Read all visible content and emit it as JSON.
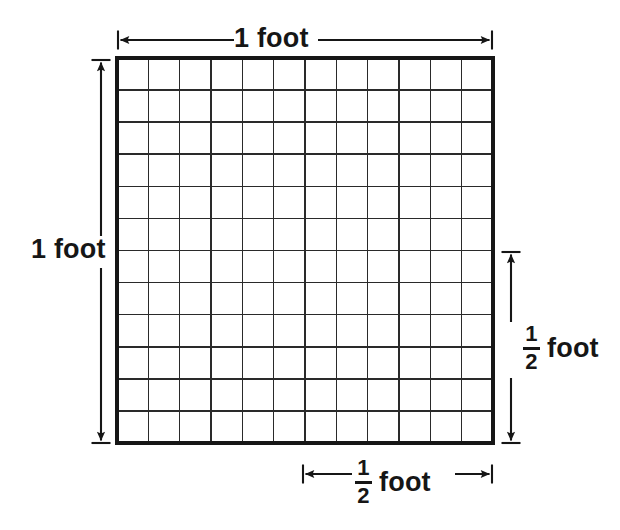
{
  "figure": {
    "background_color": "#ffffff",
    "line_color": "#161616",
    "grid": {
      "columns": 12,
      "rows": 12,
      "left": 117,
      "top": 58,
      "right": 493,
      "bottom": 443,
      "cell_width": 31.33,
      "cell_height": 32.08,
      "border_width": 3.2,
      "gridline_width": 1.5
    },
    "labels": {
      "top": "1 foot",
      "left": "1 foot",
      "right_fraction_numerator": "1",
      "right_fraction_denominator": "2",
      "right_unit": "foot",
      "bottom_fraction_numerator": "1",
      "bottom_fraction_denominator": "2",
      "bottom_unit": "foot"
    },
    "dimension_arrows": [
      {
        "name": "top-width-arrow",
        "orientation": "horizontal",
        "from": 118,
        "to": 492,
        "axis_position": 40,
        "label": "1 foot",
        "measures": "full width"
      },
      {
        "name": "left-height-arrow",
        "orientation": "vertical",
        "from": 60,
        "to": 443,
        "axis_position": 101,
        "label": "1 foot",
        "measures": "full height"
      },
      {
        "name": "right-half-height-arrow",
        "orientation": "vertical",
        "from": 252,
        "to": 443,
        "axis_position": 511,
        "label": "1/2 foot",
        "measures": "half height"
      },
      {
        "name": "bottom-half-width-arrow",
        "orientation": "horizontal",
        "from": 303,
        "to": 492,
        "axis_position": 474,
        "label": "1/2 foot",
        "measures": "half width"
      }
    ]
  }
}
